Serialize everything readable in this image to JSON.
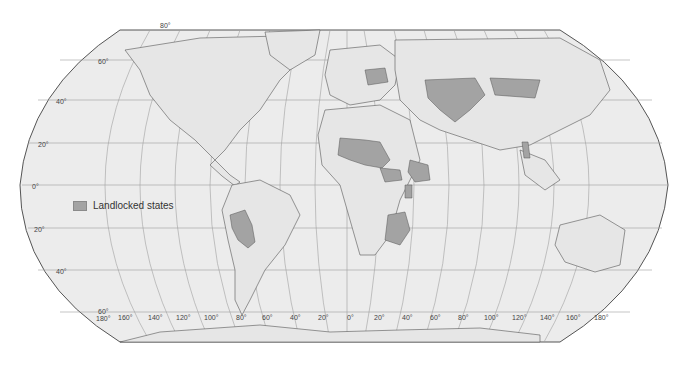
{
  "map": {
    "title": "World map of landlocked states",
    "projection": "Robinson",
    "colors": {
      "ocean": "#ececec",
      "land": "#e6e6e6",
      "landlocked": "#a3a3a3",
      "border": "#555555",
      "graticule": "#9a9a9a",
      "frame": "#555555"
    },
    "legend": {
      "label": "Landlocked states",
      "swatch_color": "#a3a3a3"
    },
    "latitude_labels": [
      "80°",
      "60°",
      "40°",
      "20°",
      "0°",
      "-20°",
      "-40°",
      "60°"
    ],
    "longitude_labels": [
      "180°",
      "160°",
      "140°",
      "120°",
      "100°",
      "80°",
      "60°",
      "40°",
      "20°",
      "0°",
      "20°",
      "40°",
      "60°",
      "80°",
      "100°",
      "120°",
      "140°",
      "160°",
      "180°"
    ],
    "highlighted_regions": [
      "Bolivia",
      "Paraguay",
      "Mali",
      "Burkina Faso",
      "Niger",
      "Chad",
      "Central African Republic",
      "Ethiopia",
      "South Sudan",
      "Uganda",
      "Rwanda",
      "Burundi",
      "Zambia",
      "Malawi",
      "Zimbabwe",
      "Botswana",
      "Lesotho",
      "Eswatini",
      "Belarus",
      "Czechia",
      "Slovakia",
      "Austria",
      "Hungary",
      "Switzerland",
      "Serbia",
      "North Macedonia",
      "Moldova",
      "Kazakhstan",
      "Uzbekistan",
      "Turkmenistan",
      "Kyrgyzstan",
      "Tajikistan",
      "Afghanistan",
      "Mongolia",
      "Nepal",
      "Bhutan",
      "Laos",
      "Armenia",
      "Azerbaijan"
    ]
  }
}
